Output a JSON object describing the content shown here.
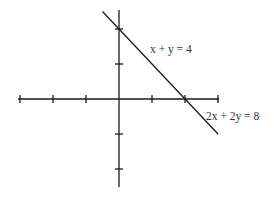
{
  "chart_data": {
    "type": "line",
    "title": "",
    "xlabel": "",
    "ylabel": "",
    "xlim": [
      -6,
      4
    ],
    "ylim": [
      -4,
      5
    ],
    "x_ticks": [
      -6,
      -4,
      -2,
      2,
      4,
      6
    ],
    "y_ticks": [
      -4,
      -2,
      2,
      4
    ],
    "tick_step": 2,
    "grid": false,
    "series": [
      {
        "name": "x + y = 4",
        "points": [
          [
            -1,
            5
          ],
          [
            6,
            -2
          ]
        ],
        "x_intercept": 4,
        "y_intercept": 4
      }
    ],
    "annotations": [
      {
        "text": "x + y = 4",
        "anchor_series": 0
      },
      {
        "text": "2x + 2y = 8",
        "anchor_series": 0
      }
    ]
  }
}
